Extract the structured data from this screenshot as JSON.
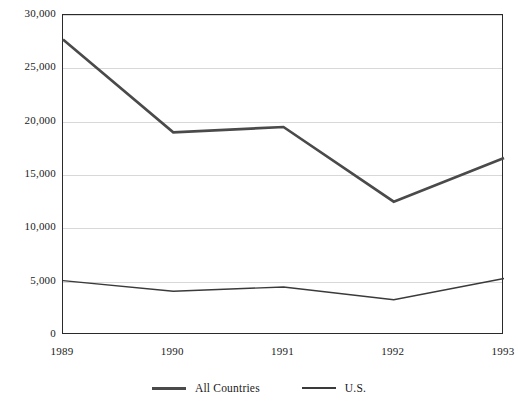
{
  "chart_data": {
    "type": "line",
    "title": "",
    "subtitle": "",
    "xlabel": "",
    "ylabel": "",
    "categories": [
      "1989",
      "1990",
      "1991",
      "1992",
      "1993"
    ],
    "series": [
      {
        "name": "All Countries",
        "values": [
          27700,
          19000,
          19500,
          12500,
          16600
        ],
        "color": "#4a4a4a",
        "line_width": 2.6
      },
      {
        "name": "U.S.",
        "values": [
          5100,
          4100,
          4500,
          3300,
          5300
        ],
        "color": "#3a3a3a",
        "line_width": 1.4
      }
    ],
    "ylim": [
      0,
      30000
    ],
    "xlim": [
      "1989",
      "1993"
    ],
    "y_ticks": [
      0,
      5000,
      10000,
      15000,
      20000,
      25000,
      30000
    ],
    "y_tick_labels": [
      "0",
      "5,000",
      "10,000",
      "15,000",
      "20,000",
      "25,000",
      "30,000"
    ],
    "x_ticks": [
      "1989",
      "1990",
      "1991",
      "1992",
      "1993"
    ],
    "grid": "horizontal",
    "grid_color": "#d8d8d8",
    "legend_position": "bottom-center",
    "frame_color": "#2a2a2a",
    "background": "#ffffff"
  },
  "legend": {
    "entries": [
      {
        "label": "All Countries",
        "style": "thick"
      },
      {
        "label": "U.S.",
        "style": "thin"
      }
    ]
  }
}
